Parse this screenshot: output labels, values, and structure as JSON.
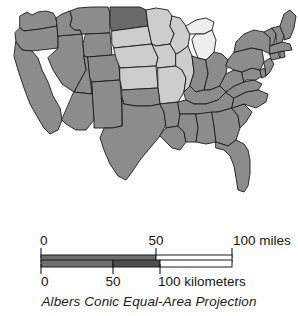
{
  "figure": {
    "projection_caption": "Albers Conic Equal-Area Projection"
  },
  "map": {
    "name": "contiguous-united-states",
    "colors": {
      "medium_gray": "#8c8c8c",
      "light_gray": "#cdcdcd",
      "dark_gray": "#6a6a6a",
      "near_white": "#eeeeee",
      "border": "#1a1a1a",
      "background": "#ffffff"
    },
    "shading_classes": [
      {
        "key": "dark",
        "label": "dark gray",
        "color": "#6a6a6a"
      },
      {
        "key": "medium",
        "label": "medium gray",
        "color": "#8c8c8c"
      },
      {
        "key": "light",
        "label": "light gray",
        "color": "#cdcdcd"
      },
      {
        "key": "lightest",
        "label": "near white",
        "color": "#eeeeee"
      }
    ],
    "regions": [
      {
        "name": "washington",
        "shade": "medium"
      },
      {
        "name": "oregon",
        "shade": "medium"
      },
      {
        "name": "california",
        "shade": "medium"
      },
      {
        "name": "nevada",
        "shade": "medium"
      },
      {
        "name": "idaho",
        "shade": "medium"
      },
      {
        "name": "montana",
        "shade": "medium"
      },
      {
        "name": "wyoming",
        "shade": "medium"
      },
      {
        "name": "utah",
        "shade": "medium"
      },
      {
        "name": "arizona",
        "shade": "medium"
      },
      {
        "name": "colorado",
        "shade": "medium"
      },
      {
        "name": "new-mexico",
        "shade": "medium"
      },
      {
        "name": "north-dakota",
        "shade": "dark"
      },
      {
        "name": "south-dakota",
        "shade": "light"
      },
      {
        "name": "nebraska",
        "shade": "light"
      },
      {
        "name": "kansas",
        "shade": "light"
      },
      {
        "name": "oklahoma",
        "shade": "medium"
      },
      {
        "name": "texas",
        "shade": "medium"
      },
      {
        "name": "minnesota",
        "shade": "light"
      },
      {
        "name": "iowa",
        "shade": "light"
      },
      {
        "name": "missouri",
        "shade": "light"
      },
      {
        "name": "arkansas",
        "shade": "medium"
      },
      {
        "name": "louisiana",
        "shade": "medium"
      },
      {
        "name": "wisconsin",
        "shade": "light"
      },
      {
        "name": "illinois",
        "shade": "light"
      },
      {
        "name": "michigan",
        "shade": "lightest"
      },
      {
        "name": "indiana",
        "shade": "medium"
      },
      {
        "name": "ohio",
        "shade": "medium"
      },
      {
        "name": "kentucky",
        "shade": "medium"
      },
      {
        "name": "tennessee",
        "shade": "medium"
      },
      {
        "name": "mississippi",
        "shade": "medium"
      },
      {
        "name": "alabama",
        "shade": "medium"
      },
      {
        "name": "georgia",
        "shade": "medium"
      },
      {
        "name": "florida",
        "shade": "medium"
      },
      {
        "name": "south-carolina",
        "shade": "medium"
      },
      {
        "name": "north-carolina",
        "shade": "medium"
      },
      {
        "name": "virginia",
        "shade": "medium"
      },
      {
        "name": "west-virginia",
        "shade": "medium"
      },
      {
        "name": "maryland",
        "shade": "medium"
      },
      {
        "name": "delaware",
        "shade": "medium"
      },
      {
        "name": "pennsylvania",
        "shade": "medium"
      },
      {
        "name": "new-jersey",
        "shade": "medium"
      },
      {
        "name": "new-york",
        "shade": "medium"
      },
      {
        "name": "connecticut",
        "shade": "medium"
      },
      {
        "name": "rhode-island",
        "shade": "medium"
      },
      {
        "name": "massachusetts",
        "shade": "medium"
      },
      {
        "name": "vermont",
        "shade": "medium"
      },
      {
        "name": "new-hampshire",
        "shade": "medium"
      },
      {
        "name": "maine",
        "shade": "medium"
      }
    ]
  },
  "scale": {
    "miles": {
      "unit_label": "100 miles",
      "ticks": [
        {
          "value": "0"
        },
        {
          "value": "50"
        },
        {
          "value": "100 miles"
        }
      ],
      "tick_values": [
        0,
        50,
        100
      ],
      "bar_fill": "#6f6f6f",
      "bar_outline": "#1a1a1a"
    },
    "kilometers": {
      "unit_label": "100 kilometers",
      "ticks": [
        {
          "value": "0"
        },
        {
          "value": "50"
        },
        {
          "value": "100 kilometers"
        }
      ],
      "tick_values": [
        0,
        50,
        100
      ],
      "bar_fill": "#5a5a5a",
      "bar_outline": "#1a1a1a"
    }
  }
}
